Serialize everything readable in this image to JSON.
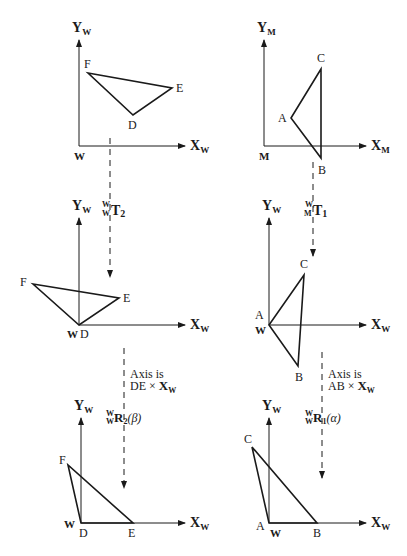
{
  "figure": {
    "colors": {
      "stroke": "#1a1a1a",
      "background": "#ffffff"
    }
  },
  "panels": {
    "top_left": {
      "frame": {
        "y_axis": "Y",
        "y_sub": "W",
        "x_axis": "X",
        "x_sub": "W",
        "origin": "W"
      },
      "vertices": {
        "F": "F",
        "E": "E",
        "D": "D"
      }
    },
    "top_right": {
      "frame": {
        "y_axis": "Y",
        "y_sub": "M",
        "x_axis": "X",
        "x_sub": "M",
        "origin": "M"
      },
      "vertices": {
        "C": "C",
        "A": "A",
        "B": "B"
      }
    },
    "mid_left": {
      "frame": {
        "y_axis": "Y",
        "y_sub": "W",
        "x_axis": "X",
        "x_sub": "W",
        "origin": "W"
      },
      "vertices": {
        "F": "F",
        "E": "E",
        "D": "D"
      }
    },
    "mid_right": {
      "frame": {
        "y_axis": "Y",
        "y_sub": "W",
        "x_axis": "X",
        "x_sub": "W",
        "origin": "W"
      },
      "vertices": {
        "C": "C",
        "A": "A",
        "B": "B"
      }
    },
    "bottom_left": {
      "frame": {
        "y_axis": "Y",
        "y_sub": "W",
        "x_axis": "X",
        "x_sub": "W",
        "origin": "W"
      },
      "vertices": {
        "F": "F",
        "E": "E",
        "D": "D"
      }
    },
    "bottom_right": {
      "frame": {
        "y_axis": "Y",
        "y_sub": "W",
        "x_axis": "X",
        "x_sub": "W",
        "origin": "W"
      },
      "vertices": {
        "C": "C",
        "A": "A",
        "B": "B"
      }
    }
  },
  "transforms": {
    "left_translate": {
      "sup": "W",
      "sub": "W",
      "symbol": "T",
      "index": "2",
      "arg": ""
    },
    "right_translate": {
      "sup": "W",
      "sub": "M",
      "symbol": "T",
      "index": "1",
      "arg": ""
    },
    "left_rotate": {
      "sup": "W",
      "sub": "W",
      "symbol": "R",
      "index": "2",
      "arg": "(β)",
      "note_line1": "Axis is",
      "note_line2_prefix": "DE ×",
      "note_axis": "X",
      "note_axis_sub": "W"
    },
    "right_rotate": {
      "sup": "W",
      "sub": "W",
      "symbol": "R",
      "index": "1",
      "arg": "(α)",
      "note_line1": "Axis is",
      "note_line2_prefix": "AB ×",
      "note_axis": "X",
      "note_axis_sub": "W"
    }
  }
}
